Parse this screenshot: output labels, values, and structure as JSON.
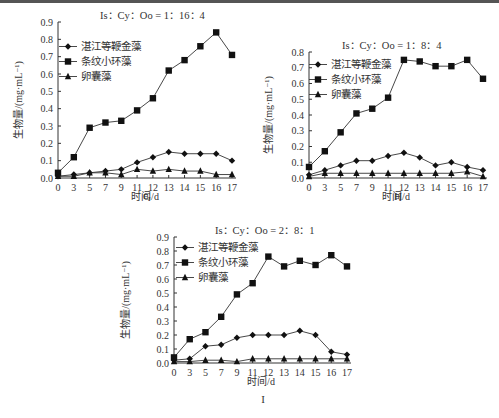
{
  "figure": {
    "panels": [
      "G",
      "H",
      "I"
    ]
  },
  "chart_data": [
    {
      "type": "line",
      "panel_label": "G",
      "title": "Is：Cy：Oo = 1：16：4",
      "xlabel": "时间/d",
      "ylabel": "生物量/(mg·mL⁻¹)",
      "x": [
        0,
        3,
        5,
        7,
        9,
        11,
        12,
        13,
        14,
        15,
        16,
        17
      ],
      "x_ticks": [
        "0",
        "3",
        "5",
        "7",
        "9",
        "11",
        "12",
        "13",
        "14",
        "15",
        "16",
        "17"
      ],
      "ylim": [
        0,
        0.9
      ],
      "y_ticks": [
        "0.0",
        "0.1",
        "0.2",
        "0.3",
        "0.4",
        "0.5",
        "0.6",
        "0.7",
        "0.8",
        "0.9"
      ],
      "grid": false,
      "legend_position": "upper-left",
      "series": [
        {
          "name": "湛江等鞭金藻",
          "marker": "diamond",
          "values": [
            0.01,
            0.02,
            0.03,
            0.04,
            0.05,
            0.09,
            0.12,
            0.15,
            0.14,
            0.14,
            0.14,
            0.1
          ]
        },
        {
          "name": "条纹小环藻",
          "marker": "square",
          "values": [
            0.03,
            0.12,
            0.29,
            0.32,
            0.33,
            0.39,
            0.46,
            0.62,
            0.68,
            0.76,
            0.84,
            0.71
          ]
        },
        {
          "name": "卵囊藻",
          "marker": "triangle",
          "values": [
            0.01,
            0.01,
            0.03,
            0.03,
            0.02,
            0.05,
            0.04,
            0.05,
            0.04,
            0.04,
            0.02,
            0.02
          ]
        }
      ]
    },
    {
      "type": "line",
      "panel_label": "H",
      "title": "Is：Cy：Oo = 1：8：4",
      "xlabel": "时间/d",
      "ylabel": "生物量/(mg·mL⁻¹)",
      "x": [
        0,
        3,
        5,
        7,
        9,
        11,
        12,
        13,
        14,
        15,
        16,
        17
      ],
      "x_ticks": [
        "0",
        "3",
        "5",
        "7",
        "9",
        "11",
        "12",
        "13",
        "14",
        "15",
        "16",
        "17"
      ],
      "ylim": [
        0,
        0.8
      ],
      "y_ticks": [
        "0.0",
        "0.1",
        "0.2",
        "0.3",
        "0.4",
        "0.5",
        "0.6",
        "0.7",
        "0.8"
      ],
      "grid": false,
      "legend_position": "upper-left",
      "series": [
        {
          "name": "湛江等鞭金藻",
          "marker": "diamond",
          "values": [
            0.02,
            0.05,
            0.08,
            0.11,
            0.11,
            0.14,
            0.16,
            0.13,
            0.08,
            0.1,
            0.07,
            0.05
          ]
        },
        {
          "name": "条纹小环藻",
          "marker": "square",
          "values": [
            0.07,
            0.17,
            0.29,
            0.41,
            0.44,
            0.51,
            0.75,
            0.74,
            0.71,
            0.71,
            0.75,
            0.63
          ]
        },
        {
          "name": "卵囊藻",
          "marker": "triangle",
          "values": [
            0.01,
            0.03,
            0.03,
            0.03,
            0.03,
            0.03,
            0.03,
            0.03,
            0.03,
            0.03,
            0.04,
            0.01
          ]
        }
      ]
    },
    {
      "type": "line",
      "panel_label": "I",
      "title": "Is：Cy：Oo = 2：8：1",
      "xlabel": "时间/d",
      "ylabel": "生物量/(mg·mL⁻¹)",
      "x": [
        0,
        3,
        5,
        7,
        9,
        11,
        12,
        13,
        14,
        15,
        16,
        17
      ],
      "x_ticks": [
        "0",
        "3",
        "5",
        "7",
        "9",
        "11",
        "12",
        "13",
        "14",
        "15",
        "16",
        "17"
      ],
      "ylim": [
        0,
        0.9
      ],
      "y_ticks": [
        "0.0",
        "0.1",
        "0.2",
        "0.3",
        "0.4",
        "0.5",
        "0.6",
        "0.7",
        "0.8",
        "0.9"
      ],
      "grid": false,
      "legend_position": "upper-left",
      "series": [
        {
          "name": "湛江等鞭金藻",
          "marker": "diamond",
          "values": [
            0.02,
            0.03,
            0.12,
            0.13,
            0.18,
            0.2,
            0.2,
            0.2,
            0.23,
            0.2,
            0.08,
            0.06
          ]
        },
        {
          "name": "条纹小环藻",
          "marker": "square",
          "values": [
            0.04,
            0.17,
            0.22,
            0.33,
            0.49,
            0.57,
            0.76,
            0.69,
            0.73,
            0.7,
            0.77,
            0.69
          ]
        },
        {
          "name": "卵囊藻",
          "marker": "triangle",
          "values": [
            0.01,
            0.01,
            0.02,
            0.02,
            0.01,
            0.03,
            0.03,
            0.03,
            0.03,
            0.03,
            0.03,
            0.03
          ]
        }
      ]
    }
  ]
}
